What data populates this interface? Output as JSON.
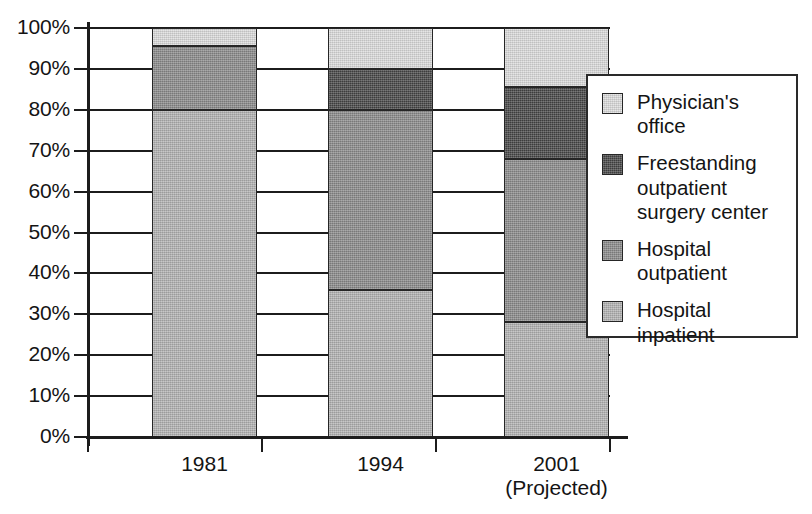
{
  "chart_data": {
    "type": "bar",
    "subtype": "stacked-percentage",
    "title": "",
    "xlabel": "",
    "ylabel": "",
    "categories": [
      "1981",
      "1994",
      "2001"
    ],
    "category_sublabels": [
      "",
      "",
      "(Projected)"
    ],
    "ylim": [
      0,
      100
    ],
    "ytick_labels": [
      "100%",
      "90%",
      "80%",
      "70%",
      "60%",
      "50%",
      "40%",
      "30%",
      "20%",
      "10%",
      "0%"
    ],
    "ytick_values": [
      100,
      90,
      80,
      70,
      60,
      50,
      40,
      30,
      20,
      10,
      0
    ],
    "grid": true,
    "legend_position": "right-inside",
    "stack_order_bottom_to_top": [
      "Hospital inpatient",
      "Hospital outpatient",
      "Freestanding outpatient surgery center",
      "Physician's office"
    ],
    "series": [
      {
        "name": "Hospital inpatient",
        "color": "#b2b2b2",
        "values": [
          80,
          36,
          28
        ]
      },
      {
        "name": "Hospital outpatient",
        "color": "#8a8a8a",
        "values": [
          15.5,
          44,
          40
        ]
      },
      {
        "name": "Freestanding outpatient surgery center",
        "color": "#464646",
        "values": [
          0,
          10,
          17.5
        ]
      },
      {
        "name": "Physician's office",
        "color": "#dcdcdc",
        "values": [
          4.5,
          10,
          14.5
        ]
      }
    ],
    "cumulative_tops": {
      "1981": [
        80,
        95.5,
        95.5,
        100
      ],
      "1994": [
        36,
        80,
        90,
        100
      ],
      "2001": [
        28,
        68,
        85.5,
        100
      ]
    }
  },
  "legend": {
    "items": [
      {
        "label": "Physician's office",
        "color": "#dcdcdc"
      },
      {
        "label": "Freestanding outpatient surgery center",
        "color": "#464646"
      },
      {
        "label": "Hospital outpatient",
        "color": "#8a8a8a"
      },
      {
        "label": "Hospital inpatient",
        "color": "#b2b2b2"
      }
    ]
  },
  "axes": {
    "y_labels": [
      "100%",
      "90%",
      "80%",
      "70%",
      "60%",
      "50%",
      "40%",
      "30%",
      "20%",
      "10%",
      "0%"
    ],
    "x_labels": [
      {
        "year": "1981",
        "note": ""
      },
      {
        "year": "1994",
        "note": ""
      },
      {
        "year": "2001",
        "note": "(Projected)"
      }
    ]
  },
  "colors": {
    "physician_office": "#dcdcdc",
    "freestanding": "#464646",
    "hospital_outpatient": "#8a8a8a",
    "hospital_inpatient": "#b2b2b2",
    "axis": "#1c1c1c",
    "background": "#ffffff"
  }
}
